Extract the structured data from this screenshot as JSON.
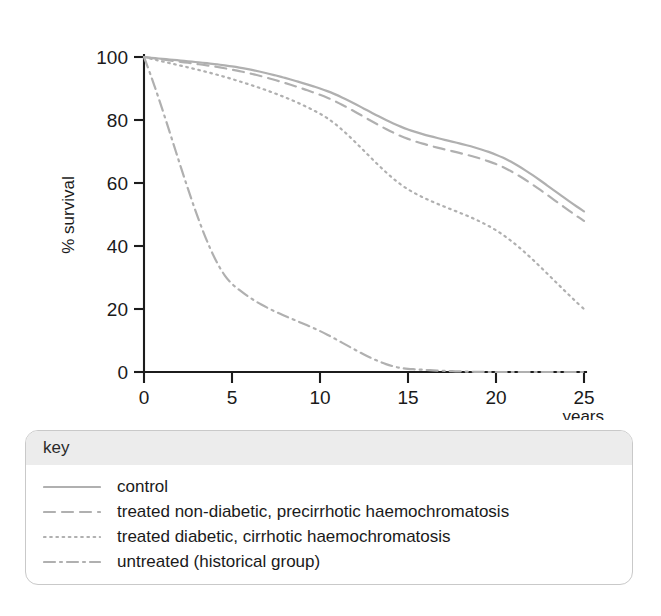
{
  "chart_data": {
    "type": "line",
    "title": "",
    "xlabel": "years",
    "ylabel": "% survival",
    "xlim": [
      0,
      25
    ],
    "ylim": [
      0,
      100
    ],
    "grid": false,
    "legend_position": "below-plot",
    "legend_title": "key",
    "x_ticks": [
      "0",
      "5",
      "10",
      "15",
      "20",
      "25"
    ],
    "y_ticks": [
      "0",
      "20",
      "40",
      "60",
      "80",
      "100"
    ],
    "x": [
      0,
      5,
      10,
      15,
      20,
      25
    ],
    "series": [
      {
        "name": "control",
        "style": "solid",
        "color": "#b0b0b0",
        "values": [
          100,
          97,
          90,
          77,
          69,
          51
        ]
      },
      {
        "name": "treated non-diabetic, precirrhotic haemochromatosis",
        "style": "dashed",
        "color": "#b0b0b0",
        "values": [
          100,
          96,
          88,
          74,
          66,
          48
        ]
      },
      {
        "name": "treated diabetic, cirrhotic haemochromatosis",
        "style": "dotted",
        "color": "#b0b0b0",
        "values": [
          100,
          93,
          82,
          58,
          45,
          20
        ]
      },
      {
        "name": "untreated (historical group)",
        "style": "dash-dot",
        "color": "#b0b0b0",
        "values": [
          100,
          28,
          13,
          1,
          0,
          0
        ]
      }
    ]
  },
  "axes": {
    "y_label": "% survival",
    "x_label": "years",
    "y_tick_labels": [
      "100",
      "80",
      "60",
      "40",
      "20",
      "0"
    ],
    "x_tick_labels": [
      "0",
      "5",
      "10",
      "15",
      "20",
      "25"
    ]
  },
  "legend": {
    "title": "key",
    "entries": [
      {
        "label": "control",
        "style": "solid"
      },
      {
        "label": "treated non-diabetic, precirrhotic haemochromatosis",
        "style": "dashed"
      },
      {
        "label": "treated diabetic, cirrhotic haemochromatosis",
        "style": "dotted"
      },
      {
        "label": "untreated (historical group)",
        "style": "dash-dot"
      }
    ]
  }
}
